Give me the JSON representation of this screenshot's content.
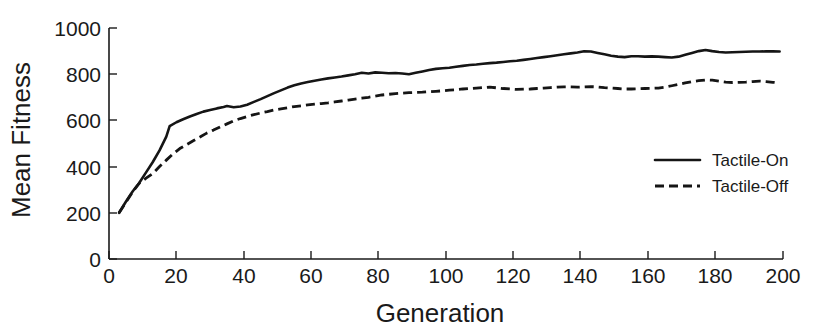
{
  "chart_data": {
    "type": "line",
    "title": "",
    "xlabel": "Generation",
    "ylabel": "Mean Fitness",
    "xlim": [
      0,
      200
    ],
    "ylim": [
      0,
      1000
    ],
    "xticks": [
      0,
      20,
      40,
      60,
      80,
      100,
      120,
      140,
      160,
      180,
      200
    ],
    "yticks": [
      0,
      200,
      400,
      600,
      800,
      1000
    ],
    "xtick_labels": [
      "0",
      "20",
      "40",
      "60",
      "80",
      "100",
      "120",
      "140",
      "160",
      "180",
      "200"
    ],
    "ytick_labels": [
      "0",
      "200",
      "400",
      "600",
      "800",
      "1000"
    ],
    "grid": false,
    "legend_position": "center-right",
    "line_color": "#151515",
    "series": [
      {
        "name": "Tactile-On",
        "style": "solid",
        "x": [
          3,
          5,
          7,
          9,
          11,
          13,
          15,
          17,
          18,
          20,
          22,
          24,
          26,
          28,
          30,
          32,
          34,
          35,
          37,
          39,
          41,
          43,
          45,
          47,
          49,
          51,
          53,
          55,
          57,
          59,
          61,
          63,
          65,
          67,
          69,
          71,
          73,
          75,
          77,
          79,
          81,
          83,
          85,
          87,
          89,
          91,
          93,
          95,
          97,
          99,
          101,
          103,
          105,
          107,
          109,
          111,
          113,
          115,
          117,
          119,
          121,
          123,
          125,
          127,
          129,
          131,
          133,
          135,
          137,
          139,
          141,
          143,
          145,
          147,
          149,
          151,
          153,
          155,
          157,
          159,
          161,
          163,
          165,
          167,
          169,
          171,
          173,
          175,
          177,
          179,
          181,
          183,
          185,
          187,
          189,
          191,
          193,
          195,
          197,
          199
        ],
        "y": [
          200,
          248,
          292,
          330,
          375,
          420,
          470,
          530,
          575,
          592,
          605,
          617,
          628,
          638,
          645,
          652,
          658,
          662,
          657,
          660,
          668,
          680,
          692,
          705,
          718,
          730,
          742,
          752,
          760,
          766,
          772,
          777,
          782,
          786,
          790,
          795,
          800,
          806,
          803,
          808,
          806,
          804,
          805,
          803,
          800,
          806,
          812,
          818,
          823,
          826,
          828,
          832,
          836,
          840,
          842,
          845,
          848,
          850,
          853,
          856,
          858,
          862,
          866,
          870,
          874,
          878,
          882,
          886,
          890,
          894,
          899,
          898,
          892,
          886,
          880,
          876,
          874,
          878,
          878,
          876,
          877,
          876,
          874,
          872,
          876,
          884,
          892,
          900,
          905,
          900,
          896,
          894,
          895,
          896,
          897,
          898,
          898,
          899,
          899,
          898
        ]
      },
      {
        "name": "Tactile-Off",
        "style": "dashed",
        "x": [
          3,
          5,
          7,
          9,
          11,
          13,
          15,
          17,
          19,
          21,
          23,
          25,
          27,
          29,
          31,
          33,
          35,
          37,
          39,
          41,
          43,
          45,
          47,
          49,
          51,
          53,
          55,
          57,
          59,
          61,
          63,
          65,
          67,
          69,
          71,
          73,
          75,
          77,
          79,
          81,
          83,
          85,
          87,
          89,
          91,
          93,
          95,
          97,
          99,
          101,
          103,
          105,
          107,
          109,
          111,
          113,
          115,
          117,
          119,
          121,
          123,
          125,
          127,
          129,
          131,
          133,
          135,
          137,
          139,
          141,
          143,
          145,
          147,
          149,
          151,
          153,
          155,
          157,
          159,
          161,
          163,
          165,
          167,
          169,
          171,
          173,
          175,
          177,
          179,
          181,
          183,
          185,
          187,
          189,
          191,
          193,
          195,
          197,
          199
        ],
        "y": [
          200,
          245,
          290,
          328,
          350,
          370,
          400,
          428,
          455,
          478,
          495,
          512,
          528,
          545,
          558,
          572,
          585,
          598,
          608,
          617,
          625,
          632,
          638,
          645,
          650,
          655,
          660,
          663,
          667,
          670,
          673,
          676,
          680,
          684,
          688,
          692,
          696,
          700,
          705,
          710,
          713,
          716,
          718,
          720,
          721,
          722,
          724,
          726,
          728,
          731,
          733,
          736,
          738,
          740,
          742,
          744,
          741,
          738,
          736,
          734,
          735,
          736,
          738,
          740,
          742,
          744,
          745,
          745,
          744,
          745,
          746,
          745,
          742,
          740,
          738,
          736,
          736,
          737,
          738,
          739,
          740,
          744,
          750,
          756,
          762,
          768,
          772,
          775,
          774,
          770,
          766,
          764,
          765,
          766,
          768,
          770,
          768,
          765,
          762
        ]
      }
    ]
  },
  "legend": {
    "entries": [
      {
        "label": "Tactile-On",
        "style": "solid"
      },
      {
        "label": "Tactile-Off",
        "style": "dashed"
      }
    ]
  }
}
